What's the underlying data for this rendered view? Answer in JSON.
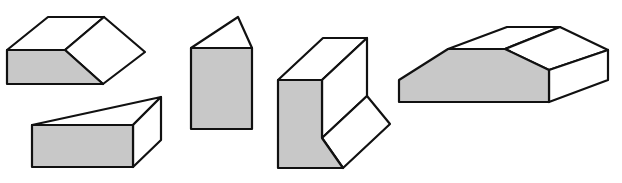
{
  "figure": {
    "colors": {
      "shaded_face": "#c8c8c8",
      "light_face": "#ffffff",
      "outline": "#111111"
    },
    "solids": [
      {
        "id": "solid-1",
        "kind": "chamfered-block",
        "shaded": "front-trapezoid"
      },
      {
        "id": "solid-2",
        "kind": "wedge",
        "shaded": "front-rectangle"
      },
      {
        "id": "solid-3",
        "kind": "triangular-prism-upright",
        "shaded": "front-rectangle"
      },
      {
        "id": "solid-4",
        "kind": "notched-block",
        "shaded": "front-face"
      },
      {
        "id": "solid-5",
        "kind": "beveled-block",
        "shaded": "front-hexagon"
      }
    ]
  }
}
